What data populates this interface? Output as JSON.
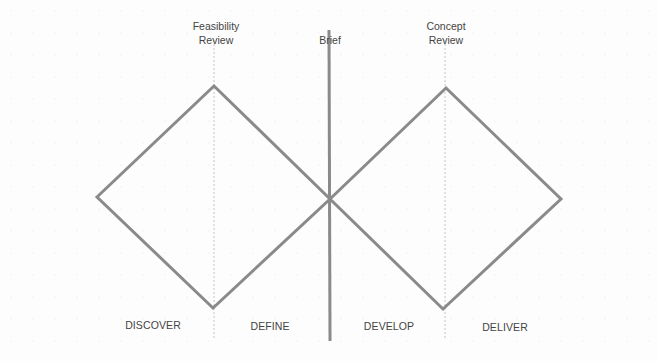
{
  "diagram": {
    "colors": {
      "line": "#8a8a8a",
      "text": "#444444",
      "dotted": "#bbbbbb"
    },
    "checkpoints": [
      {
        "id": "feasibility",
        "label_line1": "Feasibility",
        "label_line2": "Review"
      },
      {
        "id": "brief",
        "label_line1": "Brief",
        "label_line2": ""
      },
      {
        "id": "concept",
        "label_line1": "Concept",
        "label_line2": "Review"
      }
    ],
    "phases": [
      {
        "label": "DISCOVER"
      },
      {
        "label": "DEFINE"
      },
      {
        "label": "DEVELOP"
      },
      {
        "label": "DELIVER"
      }
    ]
  }
}
